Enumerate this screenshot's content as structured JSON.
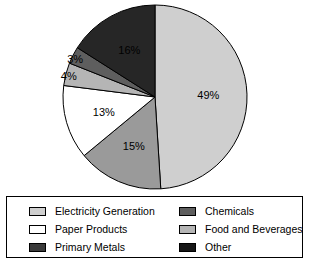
{
  "chart_data": {
    "type": "pie",
    "title": "",
    "xlabel": "",
    "ylabel": "",
    "legend_position": "bottom",
    "grid": false,
    "start_angle_deg": 0,
    "direction": "clockwise",
    "categories": [
      "Electricity Generation",
      "Primary Metals",
      "Paper Products",
      "Food and Beverages",
      "Chemicals",
      "Other"
    ],
    "values": [
      49,
      15,
      13,
      4,
      3,
      16
    ],
    "labels": [
      "49%",
      "15%",
      "13%",
      "4%",
      "3%",
      "16%"
    ],
    "colors": [
      "#cfcfcf",
      "#9a9a9a",
      "#ffffff",
      "#b5b5b5",
      "#5e5e5e",
      "#262626"
    ],
    "slices": [
      {
        "name": "Electricity Generation",
        "value": 49,
        "label": "49%",
        "color": "#cfcfcf",
        "label_color": "#000000"
      },
      {
        "name": "Primary Metals",
        "value": 15,
        "label": "15%",
        "color": "#9a9a9a",
        "label_color": "#000000"
      },
      {
        "name": "Paper Products",
        "value": 13,
        "label": "13%",
        "color": "#ffffff",
        "label_color": "#000000"
      },
      {
        "name": "Food and Beverages",
        "value": 4,
        "label": "4%",
        "color": "#b5b5b5",
        "label_color": "#000000"
      },
      {
        "name": "Chemicals",
        "value": 3,
        "label": "3%",
        "color": "#5e5e5e",
        "label_color": "#000000"
      },
      {
        "name": "Other",
        "value": 16,
        "label": "16%",
        "color": "#262626",
        "label_color": "#ffffff"
      }
    ]
  },
  "legend": {
    "left_column": [
      {
        "label": "Electricity Generation",
        "color": "#cfcfcf"
      },
      {
        "label": "Paper Products",
        "color": "#ffffff"
      },
      {
        "label": "Primary Metals",
        "color": "#3a3a3a"
      }
    ],
    "right_column": [
      {
        "label": "Chemicals",
        "color": "#5e5e5e"
      },
      {
        "label": "Food and Beverages",
        "color": "#b5b5b5"
      },
      {
        "label": "Other",
        "color": "#161616"
      }
    ]
  }
}
